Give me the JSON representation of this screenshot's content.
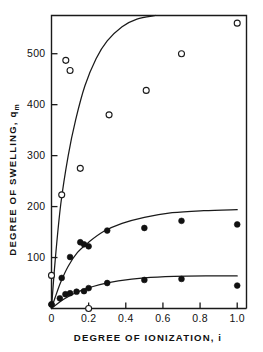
{
  "chart_data": {
    "type": "scatter",
    "title": "",
    "xlabel": "DEGREE OF IONIZATION, i",
    "ylabel_main": "DEGREE OF SWELLING, q",
    "ylabel_sub": "m",
    "xlim": [
      0.0,
      1.05
    ],
    "ylim": [
      0,
      575
    ],
    "grid": false,
    "legend": "none",
    "xticks": [
      "0",
      "0.2",
      "0.4",
      "0.6",
      "0.8",
      "1.0"
    ],
    "xtick_values": [
      0.0,
      0.2,
      0.4,
      0.6,
      0.8,
      1.0
    ],
    "yticks": [
      "100",
      "200",
      "300",
      "400",
      "500"
    ],
    "ytick_values": [
      100,
      200,
      300,
      400,
      500
    ],
    "series": [
      {
        "name": "open-circles",
        "marker": "open-circle",
        "x": [
          0.0,
          0.055,
          0.077,
          0.1,
          0.155,
          0.2,
          0.31,
          0.51,
          0.7,
          1.0
        ],
        "y": [
          65,
          223,
          487,
          467,
          275,
          0,
          380,
          428,
          500,
          560
        ]
      },
      {
        "name": "filled-circles-upper",
        "marker": "filled-circle",
        "x": [
          0.0,
          0.055,
          0.1,
          0.155,
          0.175,
          0.2,
          0.3,
          0.5,
          0.7,
          1.0
        ],
        "y": [
          8,
          60,
          101,
          130,
          126,
          122,
          153,
          158,
          172,
          165
        ]
      },
      {
        "name": "filled-circles-lower",
        "marker": "filled-circle",
        "x": [
          0.0,
          0.045,
          0.075,
          0.1,
          0.135,
          0.175,
          0.2,
          0.3,
          0.5,
          0.7,
          1.0
        ],
        "y": [
          8,
          20,
          28,
          30,
          33,
          34,
          40,
          50,
          56,
          58,
          45
        ]
      }
    ],
    "curves": [
      {
        "name": "curve-upper",
        "x": [
          0.0,
          0.02,
          0.05,
          0.09,
          0.13,
          0.18,
          0.24,
          0.3,
          0.38,
          0.46,
          0.56
        ],
        "y": [
          0,
          95,
          205,
          300,
          370,
          437,
          490,
          525,
          553,
          568,
          575
        ]
      },
      {
        "name": "curve-middle",
        "x": [
          0.0,
          0.02,
          0.05,
          0.09,
          0.14,
          0.2,
          0.28,
          0.38,
          0.5,
          0.65,
          0.82,
          1.0
        ],
        "y": [
          0,
          22,
          52,
          83,
          110,
          130,
          151,
          167,
          179,
          188,
          192,
          194
        ]
      },
      {
        "name": "curve-lower",
        "x": [
          0.0,
          0.03,
          0.07,
          0.12,
          0.18,
          0.26,
          0.36,
          0.5,
          0.66,
          0.84,
          1.0
        ],
        "y": [
          0,
          9,
          19,
          29,
          38,
          47,
          54,
          60,
          63,
          64,
          64
        ]
      }
    ]
  }
}
